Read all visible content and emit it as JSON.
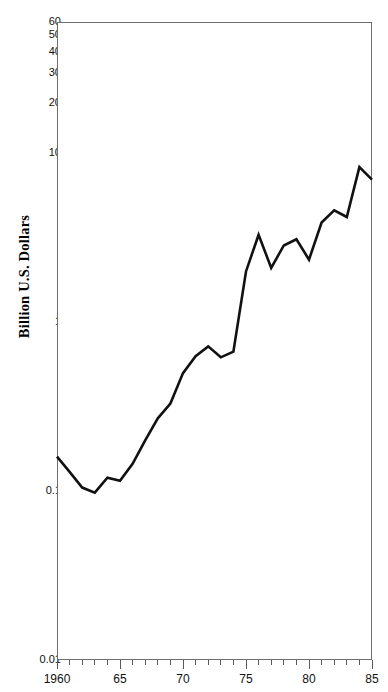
{
  "chart_data": {
    "type": "line",
    "title": "",
    "subtitle": "",
    "xlabel": "",
    "ylabel": "Billion U.S. Dollars",
    "yscale": "log",
    "ylim": [
      0.01,
      60
    ],
    "xlim": [
      1960,
      1985
    ],
    "grid": false,
    "legend": null,
    "y_tick_labels": [
      "60",
      "50",
      "40",
      "30",
      "20",
      "10",
      "1",
      "0.1",
      "0.01"
    ],
    "y_tick_values": [
      60,
      50,
      40,
      30,
      20,
      10,
      1,
      0.1,
      0.01
    ],
    "x_tick_labels": [
      "1960",
      "65",
      "70",
      "75",
      "80",
      "85"
    ],
    "x_tick_values": [
      1960,
      1965,
      1970,
      1975,
      1980,
      1985
    ],
    "x_minor_tick_values": [
      1961,
      1962,
      1963,
      1964,
      1966,
      1967,
      1968,
      1969,
      1971,
      1972,
      1973,
      1974,
      1976,
      1977,
      1978,
      1979,
      1981,
      1982,
      1983,
      1984
    ],
    "series": [
      {
        "name": "Billion U.S. Dollars",
        "color": "#111111",
        "x": [
          1960,
          1961,
          1962,
          1963,
          1964,
          1965,
          1966,
          1967,
          1968,
          1969,
          1970,
          1971,
          1972,
          1973,
          1974,
          1975,
          1976,
          1977,
          1978,
          1979,
          1980,
          1981,
          1982,
          1983,
          1984,
          1985
        ],
        "values": [
          0.16,
          0.13,
          0.105,
          0.098,
          0.12,
          0.115,
          0.145,
          0.2,
          0.27,
          0.33,
          0.5,
          0.63,
          0.72,
          0.62,
          0.67,
          2.0,
          3.3,
          2.1,
          2.85,
          3.1,
          2.35,
          3.9,
          4.6,
          4.2,
          8.3,
          7.0
        ]
      }
    ]
  },
  "axis": {
    "y_title": "Billion U.S. Dollars"
  }
}
